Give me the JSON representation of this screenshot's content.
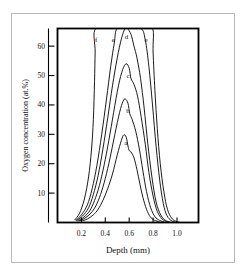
{
  "chart_data": {
    "type": "line",
    "title": "",
    "xlabel": "Depth (mm)",
    "ylabel": "Oxygen concentration (at.%)",
    "xlim": [
      0.0,
      1.18
    ],
    "ylim": [
      0,
      66
    ],
    "grid": false,
    "legend_position": "inline-curve-labels",
    "xticks": [
      "0.2",
      "0.4",
      "0.6",
      "0.8",
      "1.0"
    ],
    "xtick_values": [
      0.2,
      0.4,
      0.6,
      0.8,
      1.0
    ],
    "yticks": [
      "10",
      "20",
      "30",
      "40",
      "50",
      "60"
    ],
    "ytick_values": [
      10,
      20,
      30,
      40,
      50,
      60
    ],
    "annotations": [
      {
        "text": "f",
        "x": 0.33,
        "y": 62
      },
      {
        "text": "e",
        "x": 0.47,
        "y": 62
      },
      {
        "text": "d",
        "x": 0.58,
        "y": 63
      },
      {
        "text": "e",
        "x": 0.745,
        "y": 62
      },
      {
        "text": "c",
        "x": 0.595,
        "y": 50
      },
      {
        "text": "b",
        "x": 0.592,
        "y": 38
      },
      {
        "text": "a",
        "x": 0.575,
        "y": 27
      }
    ],
    "series": [
      {
        "name": "a",
        "peak_x": 0.55,
        "peak_y": 30,
        "points": [
          [
            0.2,
            0.5
          ],
          [
            0.25,
            1.2
          ],
          [
            0.3,
            2.6
          ],
          [
            0.34,
            4.5
          ],
          [
            0.38,
            7.5
          ],
          [
            0.42,
            11.5
          ],
          [
            0.46,
            16.5
          ],
          [
            0.5,
            23.0
          ],
          [
            0.535,
            28.0
          ],
          [
            0.555,
            29.8
          ],
          [
            0.575,
            29.0
          ],
          [
            0.59,
            26.0
          ],
          [
            0.6,
            24.5
          ],
          [
            0.615,
            24.0
          ],
          [
            0.64,
            22.0
          ],
          [
            0.665,
            18.0
          ],
          [
            0.69,
            13.0
          ],
          [
            0.715,
            8.5
          ],
          [
            0.745,
            4.5
          ],
          [
            0.775,
            2.0
          ],
          [
            0.81,
            0.8
          ],
          [
            0.85,
            0.3
          ]
        ]
      },
      {
        "name": "b",
        "peak_x": 0.565,
        "peak_y": 42,
        "points": [
          [
            0.18,
            0.5
          ],
          [
            0.23,
            1.5
          ],
          [
            0.28,
            3.2
          ],
          [
            0.32,
            5.6
          ],
          [
            0.36,
            9.5
          ],
          [
            0.4,
            15.0
          ],
          [
            0.44,
            22.0
          ],
          [
            0.48,
            30.0
          ],
          [
            0.52,
            37.5
          ],
          [
            0.548,
            41.2
          ],
          [
            0.568,
            42.0
          ],
          [
            0.59,
            40.5
          ],
          [
            0.605,
            37.0
          ],
          [
            0.625,
            35.0
          ],
          [
            0.655,
            31.0
          ],
          [
            0.685,
            25.0
          ],
          [
            0.715,
            17.5
          ],
          [
            0.745,
            10.5
          ],
          [
            0.78,
            5.0
          ],
          [
            0.815,
            2.0
          ],
          [
            0.855,
            0.7
          ],
          [
            0.89,
            0.2
          ]
        ]
      },
      {
        "name": "c",
        "peak_x": 0.575,
        "peak_y": 54,
        "points": [
          [
            0.17,
            0.6
          ],
          [
            0.22,
            1.8
          ],
          [
            0.27,
            4.0
          ],
          [
            0.31,
            7.5
          ],
          [
            0.35,
            12.5
          ],
          [
            0.39,
            19.5
          ],
          [
            0.43,
            28.0
          ],
          [
            0.47,
            37.5
          ],
          [
            0.51,
            46.5
          ],
          [
            0.545,
            52.0
          ],
          [
            0.575,
            54.0
          ],
          [
            0.6,
            52.5
          ],
          [
            0.615,
            49.0
          ],
          [
            0.64,
            47.0
          ],
          [
            0.67,
            43.0
          ],
          [
            0.7,
            36.0
          ],
          [
            0.735,
            26.5
          ],
          [
            0.765,
            17.0
          ],
          [
            0.8,
            9.0
          ],
          [
            0.835,
            3.8
          ],
          [
            0.875,
            1.2
          ],
          [
            0.915,
            0.3
          ]
        ]
      },
      {
        "name": "d",
        "peak_x": 0.585,
        "peak_y": 66,
        "clipped_top": true,
        "points": [
          [
            0.16,
            0.7
          ],
          [
            0.21,
            2.2
          ],
          [
            0.26,
            5.0
          ],
          [
            0.3,
            9.5
          ],
          [
            0.34,
            16.0
          ],
          [
            0.38,
            25.0
          ],
          [
            0.42,
            35.5
          ],
          [
            0.46,
            46.5
          ],
          [
            0.5,
            56.0
          ],
          [
            0.535,
            62.5
          ],
          [
            0.565,
            66.0
          ],
          [
            0.585,
            66.0
          ],
          [
            0.615,
            64.0
          ],
          [
            0.64,
            60.0
          ],
          [
            0.665,
            56.0
          ],
          [
            0.695,
            49.0
          ],
          [
            0.725,
            39.0
          ],
          [
            0.755,
            27.0
          ],
          [
            0.79,
            15.5
          ],
          [
            0.825,
            7.0
          ],
          [
            0.865,
            2.5
          ],
          [
            0.905,
            0.7
          ],
          [
            0.94,
            0.2
          ]
        ]
      },
      {
        "name": "e",
        "peak_x": 0.6,
        "peak_y": 66,
        "clipped_top": true,
        "points": [
          [
            0.155,
            0.8
          ],
          [
            0.2,
            2.6
          ],
          [
            0.25,
            6.0
          ],
          [
            0.29,
            11.5
          ],
          [
            0.33,
            19.5
          ],
          [
            0.37,
            30.0
          ],
          [
            0.41,
            42.0
          ],
          [
            0.445,
            53.0
          ],
          [
            0.475,
            61.0
          ],
          [
            0.5,
            66.0
          ],
          [
            0.6,
            66.0
          ],
          [
            0.7,
            66.0
          ],
          [
            0.735,
            62.0
          ],
          [
            0.765,
            53.0
          ],
          [
            0.795,
            40.0
          ],
          [
            0.825,
            26.0
          ],
          [
            0.855,
            14.5
          ],
          [
            0.885,
            6.5
          ],
          [
            0.915,
            2.4
          ],
          [
            0.95,
            0.7
          ],
          [
            0.98,
            0.2
          ]
        ]
      },
      {
        "name": "f",
        "peak_x": 0.55,
        "peak_y": 66,
        "clipped_top": true,
        "points": [
          [
            0.145,
            0.9
          ],
          [
            0.185,
            3.2
          ],
          [
            0.225,
            8.0
          ],
          [
            0.26,
            15.5
          ],
          [
            0.285,
            25.0
          ],
          [
            0.3,
            35.0
          ],
          [
            0.31,
            48.0
          ],
          [
            0.315,
            58.0
          ],
          [
            0.32,
            66.0
          ],
          [
            0.5,
            66.0
          ],
          [
            0.7,
            66.0
          ],
          [
            0.795,
            66.0
          ],
          [
            0.8,
            58.0
          ],
          [
            0.815,
            45.0
          ],
          [
            0.835,
            32.0
          ],
          [
            0.86,
            20.0
          ],
          [
            0.89,
            10.5
          ],
          [
            0.92,
            4.5
          ],
          [
            0.955,
            1.5
          ],
          [
            0.99,
            0.4
          ],
          [
            1.02,
            0.1
          ]
        ]
      }
    ]
  },
  "axes": {
    "x_axis_title": "Depth (mm)",
    "y_axis_title": "Oxygen concentration (at.%)"
  }
}
